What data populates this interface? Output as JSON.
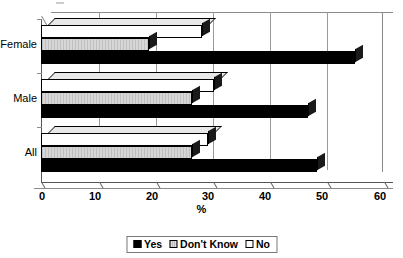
{
  "chart_data": {
    "type": "bar",
    "orientation": "horizontal",
    "title": "",
    "subtitle": "",
    "xlabel": "%",
    "ylabel": "",
    "xlim": [
      0,
      60
    ],
    "xticks": [
      0,
      10,
      20,
      30,
      40,
      50,
      60
    ],
    "categories": [
      "Female",
      "Male",
      "All"
    ],
    "grid": true,
    "grid_axis": "x",
    "legend_position": "bottom",
    "series": [
      {
        "name": "Yes",
        "color": "#000000",
        "values": [
          53.5,
          45.5,
          47.0
        ]
      },
      {
        "name": "Don't Know",
        "color": "#cccccc",
        "values": [
          19.0,
          26.5,
          26.5
        ]
      },
      {
        "name": "No",
        "color": "#ffffff",
        "values": [
          27.5,
          29.5,
          28.5
        ]
      }
    ],
    "annotations": []
  },
  "axis": {
    "x_label": "%",
    "tick_labels": [
      "0",
      "10",
      "20",
      "30",
      "40",
      "50",
      "60"
    ],
    "category_labels": [
      "Female",
      "Male",
      "All"
    ]
  },
  "legend": {
    "items": [
      {
        "label": "Yes",
        "swatch": "black-square-swatch"
      },
      {
        "label": "Don't Know",
        "swatch": "gray-hatched-square-swatch"
      },
      {
        "label": "No",
        "swatch": "white-square-swatch"
      }
    ]
  },
  "colors": {
    "yes": "#000000",
    "dont_know": "#cccccc",
    "no": "#ffffff",
    "axis": "#666666",
    "grid": "#9a9a9a",
    "background": "#ffffff"
  }
}
